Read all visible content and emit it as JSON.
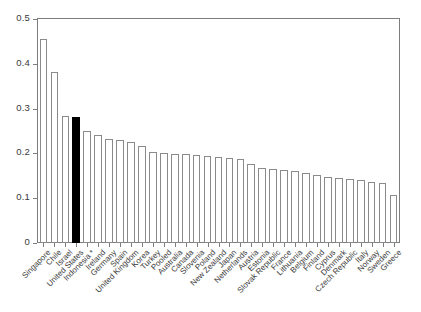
{
  "chart_data": {
    "type": "bar",
    "title": "",
    "subtitle": "",
    "xlabel": "",
    "ylabel": "",
    "ylim": [
      0,
      0.5
    ],
    "yticks": [
      "0",
      "0.1",
      "0.2",
      "0.3",
      "0.4",
      "0.5"
    ],
    "ytick_values": [
      0,
      0.1,
      0.2,
      0.3,
      0.4,
      0.5
    ],
    "grid": false,
    "legend": null,
    "highlight_category": "United States",
    "highlight_color": "#000000",
    "bar_fill_color": "#ffffff",
    "bar_edge_color": "#8a8a8a",
    "axis_color": "#7d7d7d",
    "categories": [
      "Singapore",
      "Chile",
      "Israel",
      "United States",
      "Indonesia *",
      "Ireland",
      "Germany",
      "Spain",
      "United Kingdom",
      "Korea",
      "Turkey",
      "Pooled",
      "Australia",
      "Canada",
      "Slovenia",
      "Poland",
      "New Zealand",
      "Japan",
      "Netherlands",
      "Austria",
      "Estonia",
      "Slovak Republic",
      "France",
      "Lithuania",
      "Belgium",
      "Finland",
      "Cyprus",
      "Denmark",
      "Czech Republic",
      "Italy",
      "Norway",
      "Sweden",
      "Greece"
    ],
    "values": [
      0.456,
      0.382,
      0.283,
      0.281,
      0.25,
      0.242,
      0.232,
      0.229,
      0.226,
      0.217,
      0.203,
      0.2,
      0.199,
      0.198,
      0.196,
      0.195,
      0.193,
      0.19,
      0.188,
      0.176,
      0.168,
      0.166,
      0.163,
      0.16,
      0.156,
      0.151,
      0.148,
      0.146,
      0.143,
      0.14,
      0.137,
      0.134,
      0.108
    ]
  }
}
